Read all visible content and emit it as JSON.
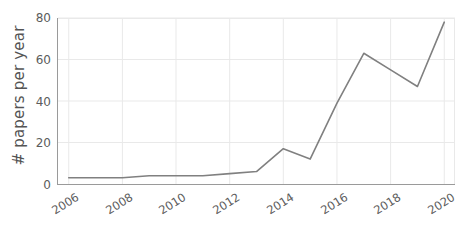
{
  "chart_data": {
    "type": "line",
    "title": "",
    "subtitle": "",
    "xlabel": "",
    "ylabel": "# papers per year",
    "x": [
      2006,
      2007,
      2008,
      2009,
      2010,
      2011,
      2012,
      2013,
      2014,
      2015,
      2016,
      2017,
      2018,
      2019,
      2020
    ],
    "values": [
      3,
      3,
      3,
      4,
      4,
      4,
      5,
      6,
      17,
      12,
      39,
      63,
      55,
      47,
      78
    ],
    "series": [
      {
        "name": "papers per year",
        "color": "#808080",
        "values": [
          3,
          3,
          3,
          4,
          4,
          4,
          5,
          6,
          17,
          12,
          39,
          63,
          55,
          47,
          78
        ]
      }
    ],
    "xlim": [
      2005.6,
      2020.4
    ],
    "ylim": [
      0,
      80
    ],
    "xticks": [
      2006,
      2008,
      2010,
      2012,
      2014,
      2016,
      2018,
      2020
    ],
    "xtick_labels": [
      "2006",
      "2008",
      "2010",
      "2012",
      "2014",
      "2016",
      "2018",
      "2020"
    ],
    "yticks": [
      0,
      20,
      40,
      60,
      80
    ],
    "ytick_labels": [
      "0",
      "20",
      "40",
      "60",
      "80"
    ],
    "grid": true,
    "grid_color": "#e9e9e9",
    "legend": false,
    "legend_position": "none",
    "markers": false,
    "background_color": "#ffffff",
    "axis_color": "#9a9a9a",
    "tick_label_color": "#5c5c5c",
    "annotations": []
  }
}
